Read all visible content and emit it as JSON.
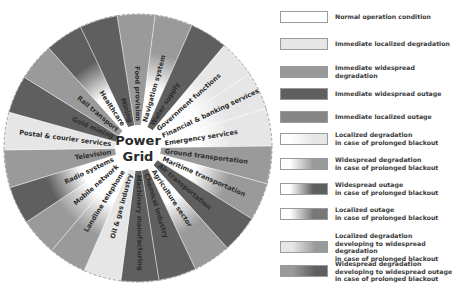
{
  "diagram": {
    "center_lines": [
      "Power",
      "Grid"
    ],
    "wheel": {
      "cx": 138,
      "cy": 148,
      "r": 134,
      "inner_r": 23
    },
    "sectors": [
      {
        "label": "Food provision",
        "status": "Immediate widespread degradation"
      },
      {
        "label": "Navigation system",
        "status": "Widespread degradation in case of prolonged blackout"
      },
      {
        "label": "Water supply",
        "status": "Immediate widespread outage"
      },
      {
        "label": "Government functions",
        "status": "Localized degradation in case of prolonged blackout"
      },
      {
        "label": "Financial & banking services",
        "status": "Localized degradation in case of prolonged blackout"
      },
      {
        "label": "Emergency services",
        "status": "Localized degradation in case of prolonged blackout"
      },
      {
        "label": "Ground transportation",
        "status": "Immediate widespread degradation"
      },
      {
        "label": "Maritime transportation",
        "status": "Widespread degradation in case of prolonged blackout"
      },
      {
        "label": "Air transportation",
        "status": "Immediate widespread outage"
      },
      {
        "label": "Agriculture sector",
        "status": "Widespread degradation in case of prolonged blackout"
      },
      {
        "label": "Chemical industry",
        "status": "Immediate widespread outage"
      },
      {
        "label": "Machinery manufacturing",
        "status": "Immediate widespread outage"
      },
      {
        "label": "Oil & gas industry",
        "status": "Immediate localized degradation"
      },
      {
        "label": "Landline telephone",
        "status": "Widespread degradation in case of prolonged blackout"
      },
      {
        "label": "Mobile network",
        "status": "Widespread degradation in case of prolonged blackout"
      },
      {
        "label": "Radio systems",
        "status": "Widespread outage in case of prolonged blackout"
      },
      {
        "label": "Television",
        "status": "Immediate widespread degradation"
      },
      {
        "label": "Postal & courier services",
        "status": "Immediate localized degradation"
      },
      {
        "label": "Gold mining",
        "status": "Immediate widespread outage"
      },
      {
        "label": "Rail transport",
        "status": "Immediate widespread degradation"
      },
      {
        "label": "Healthcare",
        "status": "Widespread outage in case of prolonged blackout"
      },
      {
        "label": "Mining",
        "status": "Immediate widespread outage"
      }
    ]
  },
  "legend": {
    "items": [
      {
        "label": "Normal operation condition",
        "style": "normal"
      },
      {
        "label": "Immediate localized degradation",
        "style": "imm-loc-deg"
      },
      {
        "label": "Immediate widespread degradation",
        "style": "imm-wide-deg"
      },
      {
        "label": "Immediate widespread outage",
        "style": "imm-wide-out"
      },
      {
        "label": "Immediate localized outage",
        "style": "imm-loc-out"
      },
      {
        "label": "Localized degradation\nin case of prolonged blackout",
        "style": "pro-loc-deg"
      },
      {
        "label": "Widespread degradation\nin case of prolonged blackout",
        "style": "pro-wide-deg"
      },
      {
        "label": "Widespread outage\nin case of prolonged blackout",
        "style": "pro-wide-out"
      },
      {
        "label": "Localized outage\nin case of prolonged blackout",
        "style": "pro-loc-out"
      },
      {
        "label": "Localized degradation\ndeveloping to widespread degradation\nin case of prolonged blackout",
        "style": "dev-loc-wide-deg"
      },
      {
        "label": "Widespread degradation\ndeveloping to widespread outage\nin case of prolonged blackout",
        "style": "dev-wide-deg-out"
      }
    ]
  },
  "colors": {
    "normal": "#ffffff",
    "loc_deg": "#e6e6e6",
    "wide_deg": "#9a9a9a",
    "wide_out": "#5f5f5f",
    "loc_out": "#868686",
    "text": "#2e2e2e",
    "border": "#9a9a9a"
  }
}
